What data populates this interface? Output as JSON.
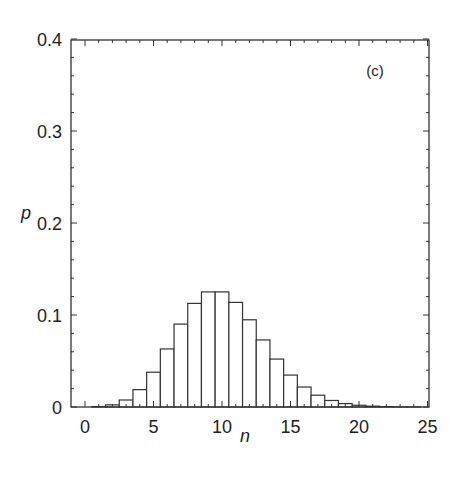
{
  "chart_data": {
    "type": "bar",
    "title": "",
    "panel_label": "(c)",
    "xlabel": "n",
    "ylabel": "p",
    "xlim": [
      -1,
      25
    ],
    "ylim": [
      0,
      0.4
    ],
    "xticks": [
      0,
      5,
      10,
      15,
      20,
      25
    ],
    "xtick_labels": [
      "0",
      "5",
      "10",
      "15",
      "20",
      "25"
    ],
    "yticks": [
      0,
      0.1,
      0.2,
      0.3,
      0.4
    ],
    "ytick_labels": [
      "0",
      "0.1",
      "0.2",
      "0.3",
      "0.4"
    ],
    "grid": false,
    "legend": null,
    "style": "histogram, unfilled bars with black outlines",
    "categories": [
      0,
      1,
      2,
      3,
      4,
      5,
      6,
      7,
      8,
      9,
      10,
      11,
      12,
      13,
      14,
      15,
      16,
      17,
      18,
      19,
      20,
      21,
      22,
      23,
      24
    ],
    "values": [
      0.0,
      0.0005,
      0.0023,
      0.0076,
      0.0189,
      0.0378,
      0.0631,
      0.0901,
      0.1126,
      0.1251,
      0.1251,
      0.1137,
      0.0948,
      0.0729,
      0.0521,
      0.0347,
      0.0217,
      0.0128,
      0.0071,
      0.0037,
      0.0019,
      0.0009,
      0.0004,
      0.0002,
      0.0001
    ]
  }
}
